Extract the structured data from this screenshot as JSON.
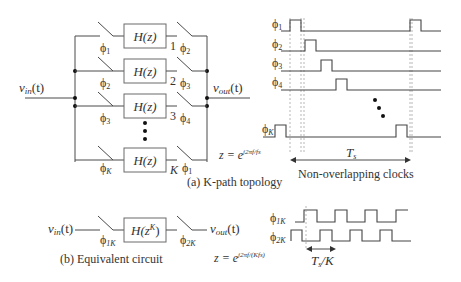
{
  "figure": {
    "kpath": {
      "caption": "(a) K-path topology",
      "input_label": "v",
      "input_sub": "in",
      "input_arg": "(t)",
      "output_label": "v",
      "output_sub": "out",
      "output_arg": "(t)",
      "block_label": "H(z)",
      "paths": [
        {
          "index": "1",
          "in_clock": "ϕ",
          "in_sub": "1",
          "out_clock": "ϕ",
          "out_sub": "2"
        },
        {
          "index": "2",
          "in_clock": "ϕ",
          "in_sub": "2",
          "out_clock": "ϕ",
          "out_sub": "3"
        },
        {
          "index": "3",
          "in_clock": "ϕ",
          "in_sub": "3",
          "out_clock": "ϕ",
          "out_sub": "4"
        },
        {
          "index": "K",
          "in_clock": "ϕ",
          "in_sub": "K",
          "out_clock": "ϕ",
          "out_sub": "1"
        }
      ],
      "z_equation": "z = e",
      "z_exponent": "j2πf/fs"
    },
    "timing": {
      "caption": "Non-overlapping clocks",
      "period_label": "T",
      "period_sub": "s",
      "clocks": [
        {
          "name": "ϕ",
          "sub": "1"
        },
        {
          "name": "ϕ",
          "sub": "2"
        },
        {
          "name": "ϕ",
          "sub": "3"
        },
        {
          "name": "ϕ",
          "sub": "4"
        },
        {
          "name": "ϕ",
          "sub": "K"
        }
      ]
    },
    "equivalent": {
      "caption": "(b) Equivalent circuit",
      "input_label": "v",
      "input_sub": "in",
      "input_arg": "(t)",
      "output_label": "v",
      "output_sub": "out",
      "output_arg": "(t)",
      "block_label": "H(z",
      "block_sup": "K",
      "block_close": ")",
      "in_clock": "ϕ",
      "in_sub": "1K",
      "out_clock": "ϕ",
      "out_sub": "2K",
      "z_equation": "z = e",
      "z_exponent": "j2πf/(Kfs)",
      "clocks": [
        {
          "name": "ϕ",
          "sub": "1K"
        },
        {
          "name": "ϕ",
          "sub": "2K"
        }
      ],
      "period_label": "T",
      "period_sub": "s",
      "period_suffix": "/K"
    }
  }
}
